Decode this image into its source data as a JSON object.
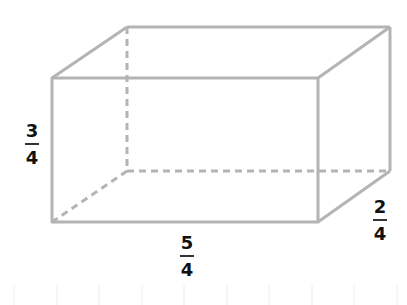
{
  "diagram": {
    "type": "rectangular-prism",
    "edge_color": "#b4b4b4",
    "hidden_edge_style": "dashed",
    "vertices": {
      "front_top_left": [
        52,
        78
      ],
      "front_top_right": [
        318,
        78
      ],
      "front_bottom_left": [
        52,
        222
      ],
      "front_bottom_right": [
        318,
        222
      ],
      "back_top_left": [
        127,
        27
      ],
      "back_top_right": [
        390,
        27
      ],
      "back_bottom_right": [
        390,
        171
      ],
      "back_bottom_left": [
        127,
        171
      ]
    },
    "labels": {
      "height": {
        "numerator": "3",
        "denominator": "4"
      },
      "length": {
        "numerator": "5",
        "denominator": "4"
      },
      "width": {
        "numerator": "2",
        "denominator": "4"
      }
    }
  }
}
